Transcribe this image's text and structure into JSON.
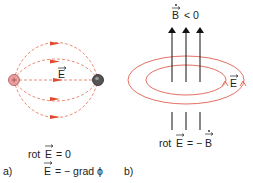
{
  "panel_a": {
    "label": "a)",
    "field_label": "E",
    "equation_1": "rot E = 0",
    "equation_1_prefix": "rot",
    "equation_1_rhs": "= 0",
    "equation_2_lhs": "E",
    "equation_2_rhs": "= − grad ϕ",
    "positive_charge_color": "#e8a0a0",
    "negative_charge_color": "#555555",
    "field_line_color": "#e85a40"
  },
  "panel_b": {
    "label": "b)",
    "b_dot_label": "B",
    "b_dot_rhs": "< 0",
    "field_label": "E",
    "equation_prefix": "rot",
    "equation_mid": "E",
    "equation_eq": "= −",
    "equation_rhs": "B",
    "loop_color": "#e06050",
    "arrow_color": "#111111"
  }
}
